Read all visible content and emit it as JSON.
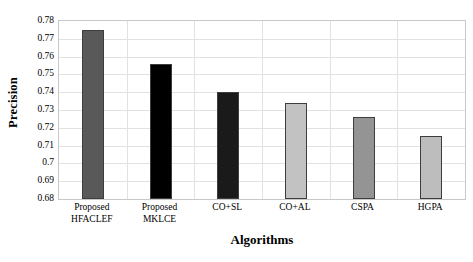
{
  "chart_data": {
    "type": "bar",
    "title": "",
    "xlabel": "Algorithms",
    "ylabel": "Precision",
    "categories": [
      "Proposed\nHFACLEF",
      "Proposed\nMKLCE",
      "CO+SL",
      "CO+AL",
      "CSPA",
      "HGPA"
    ],
    "values": [
      0.775,
      0.756,
      0.74,
      0.734,
      0.726,
      0.7155
    ],
    "bar_colors": [
      "#595959",
      "#000000",
      "#1a1a1a",
      "#c2c2c2",
      "#949494",
      "#bdbdbd"
    ],
    "ylim": [
      0.68,
      0.78
    ],
    "ytick_labels": [
      "0.68",
      "0.69",
      "0.7",
      "0.71",
      "0.72",
      "0.73",
      "0.74",
      "0.75",
      "0.76",
      "0.77",
      "0.78"
    ],
    "ytick_values": [
      0.68,
      0.69,
      0.7,
      0.71,
      0.72,
      0.73,
      0.74,
      0.75,
      0.76,
      0.77,
      0.78
    ],
    "grid": true,
    "legend": "none"
  }
}
